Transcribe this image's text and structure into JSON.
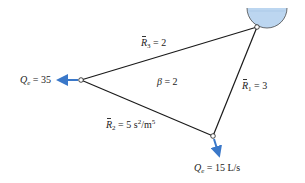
{
  "diagram": {
    "type": "pipe network loop",
    "colors": {
      "pipe": "#1a1a1a",
      "arrow": "#3a78c9",
      "water": "#bcd6f0",
      "reservoir_outline": "#4a4a4a"
    },
    "nodes": [
      {
        "id": "reservoir",
        "x": 257,
        "y": 27
      },
      {
        "id": "left",
        "x": 81,
        "y": 80
      },
      {
        "id": "bottom",
        "x": 213,
        "y": 136
      }
    ],
    "pipes": [
      {
        "id": "pipe-1",
        "from": "reservoir",
        "to": "bottom",
        "symbol": "R",
        "subscript": "1",
        "value": "= 3"
      },
      {
        "id": "pipe-2",
        "from": "left",
        "to": "bottom",
        "symbol": "R",
        "subscript": "2",
        "value": "= 5 s",
        "unit_tail": "/m",
        "sup1": "2",
        "sup2": "5"
      },
      {
        "id": "pipe-3",
        "from": "reservoir",
        "to": "left",
        "symbol": "R",
        "subscript": "3",
        "value": "= 2"
      }
    ],
    "loop_label": {
      "symbol": "β",
      "value": "= 2"
    },
    "demands": [
      {
        "node": "left",
        "symbol": "Q",
        "subscript": "e",
        "value": "= 35"
      },
      {
        "node": "bottom",
        "symbol": "Q",
        "subscript": "e",
        "value": "= 15 L/s"
      }
    ]
  }
}
